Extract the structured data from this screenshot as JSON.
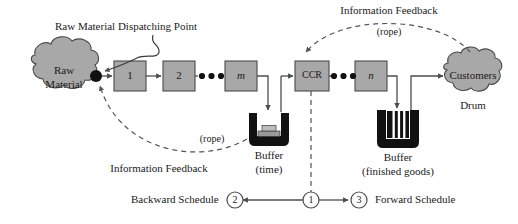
{
  "figure": {
    "type": "drum-buffer-rope-flow-diagram",
    "background_color": "#ffffff",
    "node_fill_color": "#a8a8a8",
    "line_color": "#4d4d4d",
    "text_color": "#1a1a1a"
  },
  "annotations": {
    "dispatching_point": "Raw Material Dispatching Point",
    "info_feedback_top": "Information Feedback",
    "rope_top": "(rope)",
    "info_feedback_bottom": "Information Feedback",
    "rope_bottom": "(rope)",
    "drum": "Drum"
  },
  "nodes": {
    "raw_material": {
      "line1": "Raw",
      "line2": "Material"
    },
    "customers": {
      "label": "Customers"
    },
    "workstations_left": [
      {
        "label": "1",
        "italic": false
      },
      {
        "label": "2",
        "italic": false
      },
      {
        "label": "m",
        "italic": true
      }
    ],
    "workstations_right": [
      {
        "label": "CCR",
        "italic": false
      },
      {
        "label": "n",
        "italic": true
      }
    ]
  },
  "buffers": [
    {
      "name": "time-buffer",
      "line1": "Buffer",
      "line2": "(time)"
    },
    {
      "name": "finished-goods-buffer",
      "line1": "Buffer",
      "line2": "(finished goods)"
    }
  ],
  "schedule": {
    "backward_label": "Backward Schedule",
    "forward_label": "Forward Schedule",
    "markers": [
      {
        "id": "2",
        "name": "marker-two"
      },
      {
        "id": "1",
        "name": "marker-one"
      },
      {
        "id": "3",
        "name": "marker-three"
      }
    ]
  }
}
